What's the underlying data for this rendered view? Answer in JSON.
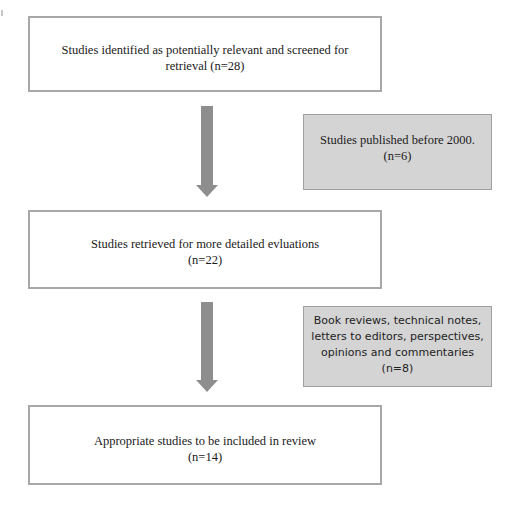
{
  "flowchart": {
    "type": "PRISMA-style study selection flow",
    "steps": [
      {
        "id": "identified",
        "lines": [
          "Studies identified as potentially relevant and screened for",
          "retrieval (n=28)"
        ],
        "text": "Studies identified as potentially relevant and screened for retrieval",
        "n": 28
      },
      {
        "id": "retrieved",
        "lines": [
          "Studies retrieved for more detailed evluations",
          "(n=22)"
        ],
        "text": "Studies retrieved for more detailed evluations",
        "n": 22
      },
      {
        "id": "included",
        "lines": [
          "Appropriate studies to be included in review",
          "(n=14)"
        ],
        "text": "Appropriate studies to be included in review",
        "n": 14
      }
    ],
    "exclusions": [
      {
        "id": "excluded-pre-2000",
        "lines": [
          "Studies published before 2000.",
          "(n=6)"
        ],
        "text": "Studies published before 2000.",
        "n": 6,
        "between": [
          "identified",
          "retrieved"
        ]
      },
      {
        "id": "excluded-article-types",
        "lines": [
          "Book reviews, technical notes,",
          "letters to editors, perspectives,",
          "opinions and commentaries",
          "(n=8)"
        ],
        "text": "Book reviews, technical notes, letters to editors, perspectives, opinions and commentaries",
        "n": 8,
        "between": [
          "retrieved",
          "included"
        ]
      }
    ],
    "arrows": [
      {
        "from": "identified",
        "to": "retrieved"
      },
      {
        "from": "retrieved",
        "to": "included"
      }
    ],
    "colors": {
      "box_border": "#a8a8a8",
      "box_fill": "#ffffff",
      "exclusion_fill": "#d4d4d4",
      "arrow": "#8e8e8e",
      "text": "#1a1a1a"
    }
  }
}
